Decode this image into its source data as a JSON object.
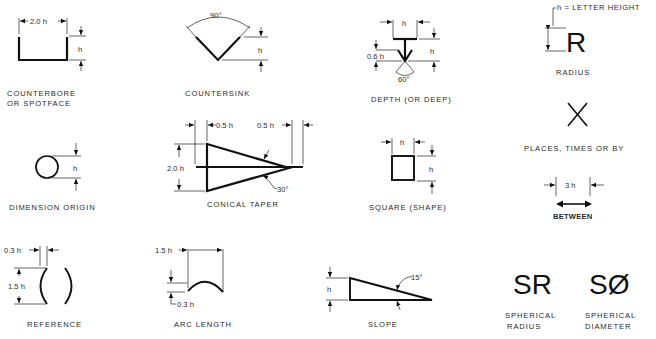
{
  "note": "h = LETTER HEIGHT",
  "symbols": {
    "counterbore": {
      "label_line1": "COUNTERBORE",
      "label_line2": "OR SPOTFACE",
      "dim_width": "2.0 h",
      "dim_height": "h"
    },
    "countersink": {
      "label": "COUNTERSINK",
      "dim_angle": "90°",
      "dim_height": "h"
    },
    "depth": {
      "label": "DEPTH (OR DEEP)",
      "dim_width": "h",
      "dim_height": "h",
      "dim_arrow": "0.6 h",
      "dim_angle": "60°"
    },
    "radius": {
      "label": "RADIUS",
      "glyph": "R"
    },
    "places": {
      "label": "PLACES, TIMES OR BY",
      "glyph": "X"
    },
    "dimension_origin": {
      "label": "DIMENSION ORIGIN",
      "dim_height": "h"
    },
    "conical_taper": {
      "label": "CONICAL TAPER",
      "dim_left": "0.5 h",
      "dim_right": "0.5 h",
      "dim_height": "2.0 h",
      "dim_angle": "30°"
    },
    "square": {
      "label": "SQUARE (SHAPE)",
      "dim_width": "h",
      "dim_height": "h"
    },
    "between": {
      "label": "BETWEEN",
      "dim_width": "3 h"
    },
    "reference": {
      "label": "REFERENCE",
      "dim_gap": "0.3 h",
      "dim_height": "1.5 h"
    },
    "arc_length": {
      "label": "ARC LENGTH",
      "dim_width": "1.5 h",
      "dim_height": "0.3 h"
    },
    "slope": {
      "label": "SLOPE",
      "dim_height": "h",
      "dim_angle": "15°"
    },
    "spherical_radius": {
      "label_line1": "SPHERICAL",
      "label_line2": "RADIUS",
      "glyph": "SR"
    },
    "spherical_diameter": {
      "label_line1": "SPHERICAL",
      "label_line2": "DIAMETER",
      "glyph": "SØ"
    }
  }
}
